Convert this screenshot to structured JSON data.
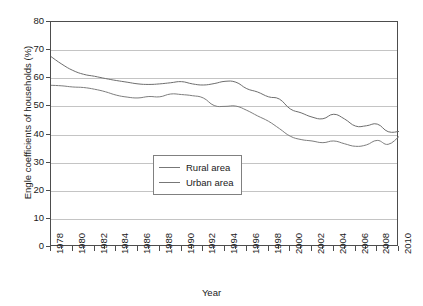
{
  "chart_data": {
    "type": "line",
    "title": "",
    "xlabel": "Year",
    "ylabel": "Engle coefficients of households (%)",
    "xlim": [
      1978,
      2010
    ],
    "ylim": [
      0,
      80
    ],
    "ytick_values": [
      0,
      10,
      20,
      30,
      40,
      50,
      60,
      70,
      80
    ],
    "xtick_values": [
      1978,
      1980,
      1982,
      1984,
      1986,
      1988,
      1990,
      1992,
      1994,
      1996,
      1998,
      2000,
      2002,
      2004,
      2006,
      2008,
      2010
    ],
    "xtick_labels": [
      "1978",
      "1980",
      "1982",
      "1984",
      "1986",
      "1988",
      "1990",
      "1992",
      "1994",
      "1996",
      "1998",
      "2000",
      "2002",
      "2004",
      "2006",
      "2008",
      "2010"
    ],
    "minor_xticks": [
      1979,
      1981,
      1983,
      1985,
      1987,
      1989,
      1991,
      1993,
      1995,
      1997,
      1999,
      2001,
      2003,
      2005,
      2007,
      2009
    ],
    "grid": "horizontal",
    "legend_position": "center-left-inside",
    "x": [
      1978,
      1979,
      1980,
      1981,
      1982,
      1983,
      1984,
      1985,
      1986,
      1987,
      1988,
      1989,
      1990,
      1991,
      1992,
      1993,
      1994,
      1995,
      1996,
      1997,
      1998,
      1999,
      2000,
      2001,
      2002,
      2003,
      2004,
      2005,
      2006,
      2007,
      2008,
      2009,
      2010
    ],
    "series": [
      {
        "name": "Rural area",
        "color": "#6e6e6e",
        "values": [
          67.7,
          65.0,
          62.8,
          61.4,
          60.7,
          59.9,
          59.2,
          58.6,
          58.0,
          57.8,
          58.0,
          58.4,
          58.8,
          58.0,
          57.6,
          58.1,
          58.9,
          58.6,
          56.3,
          55.1,
          53.4,
          52.6,
          49.1,
          47.7,
          46.2,
          45.6,
          47.2,
          45.5,
          43.0,
          43.1,
          43.7,
          41.0,
          41.1
        ],
        "endpoint_value": 41.1
      },
      {
        "name": "Urban area",
        "color": "#7d7d7d",
        "values": [
          57.5,
          57.3,
          56.9,
          56.7,
          56.1,
          55.2,
          54.0,
          53.3,
          53.0,
          53.5,
          53.4,
          54.4,
          54.2,
          53.8,
          53.0,
          50.3,
          50.0,
          50.1,
          48.6,
          46.6,
          44.7,
          42.1,
          39.4,
          38.2,
          37.7,
          37.1,
          37.7,
          36.7,
          35.8,
          36.3,
          37.9,
          36.5,
          39.3
        ],
        "endpoint_value": 39.3
      }
    ]
  },
  "legend": {
    "items": [
      {
        "label": "Rural area"
      },
      {
        "label": "Urban area"
      }
    ]
  },
  "edge_note": ""
}
